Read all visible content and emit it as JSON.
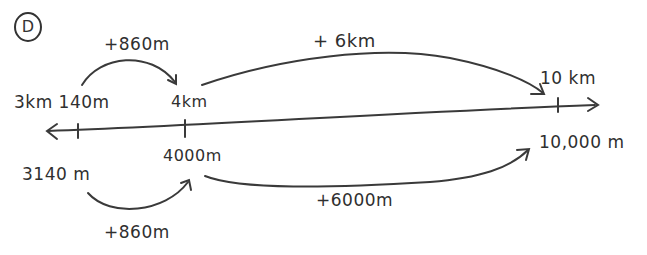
{
  "problem_label": "D",
  "number_line": {
    "direction": "both",
    "ticks": [
      {
        "top_label": "3km 140m",
        "bottom_label": "3140 m"
      },
      {
        "top_label": "4km",
        "bottom_label": "4000m"
      },
      {
        "top_label": "10 km",
        "bottom_label": "10,000 m"
      }
    ]
  },
  "jumps_top": [
    {
      "label": "+860m",
      "from": "3km 140m",
      "to": "4km"
    },
    {
      "label": "+ 6km",
      "from": "4km",
      "to": "10 km"
    }
  ],
  "jumps_bottom": [
    {
      "label": "+860m",
      "from": "3140 m",
      "to": "4000m"
    },
    {
      "label": "+6000m",
      "from": "4000m",
      "to": "10,000 m"
    }
  ],
  "colors": {
    "ink": "#2f2f2f",
    "background": "#ffffff"
  }
}
